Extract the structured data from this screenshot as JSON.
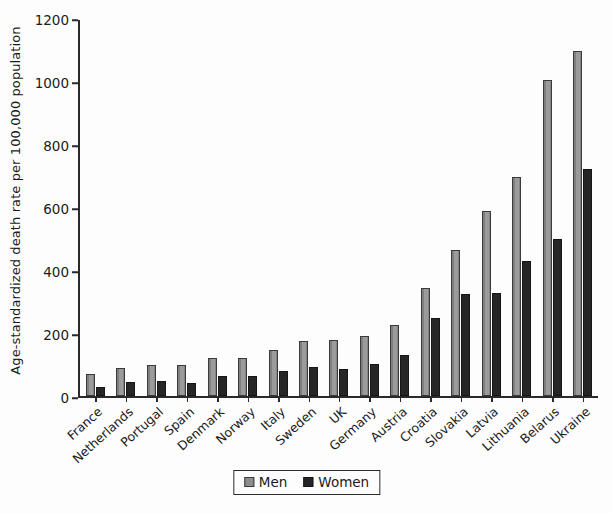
{
  "chart_data": {
    "type": "bar",
    "title": "",
    "xlabel": "",
    "ylabel": "Age-standardized death rate per 100,000 population",
    "ylim": [
      0,
      1200
    ],
    "yticks": [
      0,
      200,
      400,
      600,
      800,
      1000,
      1200
    ],
    "grid": false,
    "legend_position": "bottom-center",
    "categories": [
      "France",
      "Netherlands",
      "Portugal",
      "Spain",
      "Denmark",
      "Norway",
      "Italy",
      "Sweden",
      "UK",
      "Germany",
      "Austria",
      "Croatia",
      "Slovakia",
      "Latvia",
      "Lithuania",
      "Belarus",
      "Ukraine"
    ],
    "series": [
      {
        "name": "Men",
        "color": "#8d8d8d",
        "values": [
          70,
          88,
          98,
          100,
          122,
          122,
          148,
          175,
          178,
          190,
          228,
          345,
          465,
          590,
          700,
          1010,
          1100
        ]
      },
      {
        "name": "Women",
        "color": "#262626",
        "values": [
          28,
          45,
          48,
          42,
          65,
          65,
          80,
          92,
          85,
          102,
          130,
          248,
          325,
          330,
          430,
          500,
          725
        ]
      }
    ]
  },
  "legend": {
    "items": [
      {
        "label": "Men",
        "swatch": "men"
      },
      {
        "label": "Women",
        "swatch": "women"
      }
    ]
  }
}
